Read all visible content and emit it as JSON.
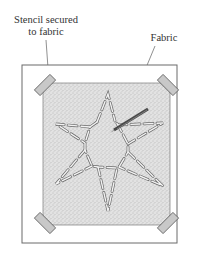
{
  "labels": {
    "stencil_line1": "Stencil secured",
    "stencil_line2": "to fabric",
    "fabric": "Fabric"
  },
  "colors": {
    "frame_stroke": "#6a6a6a",
    "stencil_fill": "#dcdcdc",
    "tape_fill": "#c8c8c8",
    "tape_stroke": "#555555",
    "text": "#333333",
    "pencil": "#555555"
  },
  "diagram": {
    "fabric_frame": {
      "x": 22,
      "y": 65,
      "w": 155,
      "h": 178
    },
    "stencil": {
      "x": 43,
      "y": 83,
      "w": 127,
      "h": 142
    },
    "tapes": [
      "top-left",
      "top-right",
      "bottom-left",
      "bottom-right"
    ],
    "motif": "six-pointed star (dashed stencil cut-outs)",
    "tool": "pencil"
  }
}
